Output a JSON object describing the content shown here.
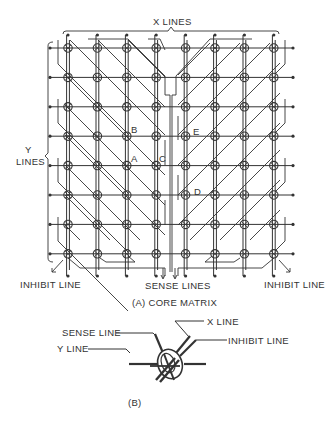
{
  "figure": {
    "panel_a": {
      "caption": "(A) CORE MATRIX",
      "x_lines_label": "X LINES",
      "y_lines_label_1": "Y",
      "y_lines_label_2": "LINES",
      "inhibit_left_label": "INHIBIT LINE",
      "inhibit_right_label": "INHIBIT LINE",
      "sense_lines_label": "SENSE LINES",
      "core_labels": {
        "A": "A",
        "B": "B",
        "C": "C",
        "D": "D",
        "E": "E"
      },
      "grid": {
        "columns": 8,
        "rows": 8
      }
    },
    "panel_b": {
      "caption": "(B)",
      "sense_line_label": "SENSE LINE",
      "y_line_label": "Y LINE",
      "x_line_label": "X LINE",
      "inhibit_line_label": "INHIBIT LINE"
    },
    "colors": {
      "ink": "#333333",
      "background": "#ffffff"
    }
  }
}
